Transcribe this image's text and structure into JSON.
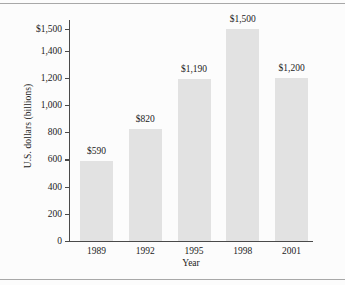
{
  "figure": {
    "background_color": "#fcfcfc",
    "rule_color": "#a8a8a8",
    "axis_color": "#4a4a4a",
    "bar_color": "#e2e2e2"
  },
  "chart_data": {
    "type": "bar",
    "title": "",
    "xlabel": "Year",
    "ylabel": "U.S. dollars (billions)",
    "categories": [
      "1989",
      "1992",
      "1995",
      "1998",
      "2001"
    ],
    "values": [
      590,
      820,
      1190,
      1500,
      1200
    ],
    "value_labels": [
      "$590",
      "$820",
      "$1,190",
      "$1,500",
      "$1,200"
    ],
    "ylim": [
      0,
      1500
    ],
    "ytick_values": [
      0,
      200,
      400,
      600,
      800,
      1000,
      1200,
      1400,
      1500
    ],
    "ytick_labels": [
      "0",
      "200",
      "400",
      "600",
      "800",
      "1,000",
      "1,200",
      "1,400",
      "$1,500"
    ],
    "grid": false,
    "legend": false,
    "note": "Top axis interval is compressed: 1,400 to 1,500 spans a 100 step while lower ticks step by 200."
  }
}
